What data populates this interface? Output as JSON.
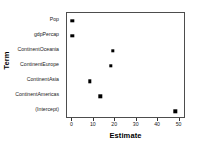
{
  "chart_data": {
    "type": "scatter",
    "title": "",
    "xlabel": "Estimate",
    "ylabel": "Term",
    "categories": [
      "Pop",
      "gdpPercap",
      "ContinentOceania",
      "ContinentEurope",
      "ContinentAsia",
      "ContinentAmericas",
      "(Intercept)"
    ],
    "values": [
      0,
      0,
      19,
      18,
      8,
      13,
      48
    ],
    "points": [
      {
        "term": "Pop",
        "estimate": 0
      },
      {
        "term": "gdpPercap",
        "estimate": 0
      },
      {
        "term": "ContinentOceania",
        "estimate": 19
      },
      {
        "term": "ContinentEurope",
        "estimate": 18
      },
      {
        "term": "ContinentAsia",
        "estimate": 8
      },
      {
        "term": "ContinentAmericas",
        "estimate": 13
      },
      {
        "term": "(Intercept)",
        "estimate": 48
      }
    ],
    "xlim": [
      -2.5,
      53
    ],
    "xticks": [
      0,
      10,
      20,
      30,
      40,
      50
    ],
    "xticklabels": [
      "0",
      "10",
      "20",
      "30",
      "40",
      "50"
    ],
    "grid": false,
    "legend": "none",
    "marker": "square",
    "marker_color": "#000000",
    "panel_border_color": "#4d4d4d",
    "background_color": "#ffffff"
  }
}
